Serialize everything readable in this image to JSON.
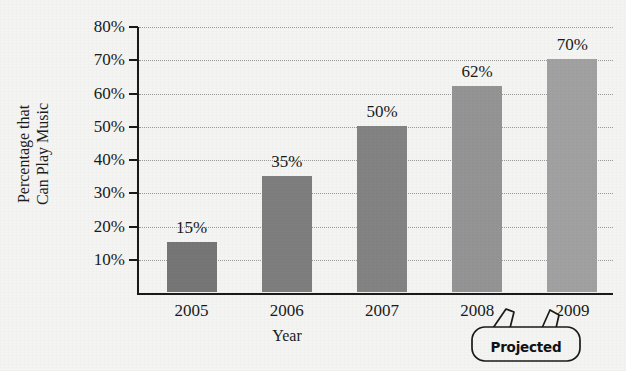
{
  "chart_data": {
    "type": "bar",
    "title": "",
    "xlabel": "Year",
    "ylabel": "Percentage that Can Play Music",
    "ylabel_lines": [
      "Percentage that",
      "Can Play Music"
    ],
    "categories": [
      "2005",
      "2006",
      "2007",
      "2008",
      "2009"
    ],
    "values": [
      15,
      35,
      50,
      62,
      70
    ],
    "value_labels": [
      "15%",
      "35%",
      "50%",
      "62%",
      "70%"
    ],
    "ylim": [
      0,
      80
    ],
    "yticks": [
      10,
      20,
      30,
      40,
      50,
      60,
      70,
      80
    ],
    "ytick_labels": [
      "10%",
      "20%",
      "30%",
      "40%",
      "50%",
      "60%",
      "70%",
      "80%"
    ],
    "grid": true,
    "grid_style": "dotted-horizontal",
    "legend": "none",
    "bar_colors": [
      "#767676",
      "#7e7e7e",
      "#838383",
      "#949494",
      "#a1a1a1"
    ],
    "annotations": [
      {
        "text": "Projected",
        "points_to": [
          "2008",
          "2009"
        ],
        "shape": "rounded-callout-with-two-tails"
      }
    ]
  },
  "annotation": {
    "projected_label": "Projected"
  },
  "background_color": "#f4f4f3",
  "axis_color": "#1a1a1a",
  "grid_color": "#9a9a9a"
}
